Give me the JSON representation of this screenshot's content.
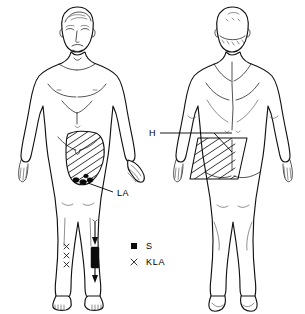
{
  "figure": {
    "background_color": "#ffffff",
    "line_color": "#111111",
    "width": 305,
    "height": 314
  },
  "views": [
    {
      "id": "anterior",
      "name": "Anterior view",
      "description": "Front-facing full body figure on the left"
    },
    {
      "id": "posterior",
      "name": "Posterior view",
      "description": "Back-facing full body figure on the right"
    }
  ],
  "annotations": {
    "la": {
      "label": "LA",
      "x": 117,
      "y": 194
    },
    "h": {
      "label": "H",
      "x": 152,
      "y": 133
    }
  },
  "legend": {
    "items": [
      {
        "symbol": "filled-square",
        "label": "S",
        "color": "#0c0c0c"
      },
      {
        "symbol": "cross-x",
        "label": "KLA",
        "color": "#111111"
      }
    ]
  },
  "markers": {
    "leg_x_marks": {
      "name": "KLA markers on lower leg",
      "count": 3
    },
    "thigh_blobs": {
      "name": "S markers at distal hatched region",
      "count": 4
    }
  },
  "regions": {
    "anterior_hatched": {
      "name": "Anterior thigh hatched region",
      "pattern": "diagonal-hatch"
    },
    "posterior_hatched": {
      "name": "Posterior gluteal hatched region",
      "pattern": "diagonal-hatch"
    }
  }
}
